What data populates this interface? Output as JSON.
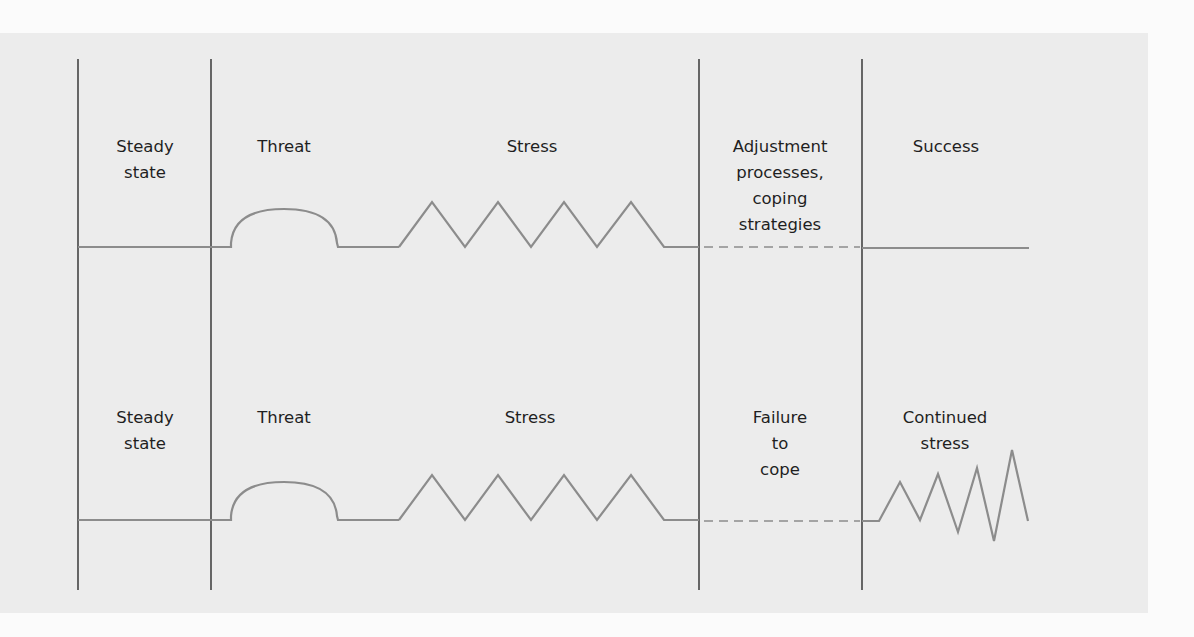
{
  "diagram": {
    "type": "stress-response flow",
    "colors": {
      "background": "#ececec",
      "divider": "#444444",
      "trace": "#8c8c8c",
      "text": "#1f1f1f"
    },
    "top_row": {
      "stages": [
        {
          "id": "steady-state",
          "label": "Steady\nstate"
        },
        {
          "id": "threat",
          "label": "Threat"
        },
        {
          "id": "stress",
          "label": "Stress"
        },
        {
          "id": "adjustment",
          "label": "Adjustment\nprocesses,\ncoping\nstrategies"
        },
        {
          "id": "success",
          "label": "Success"
        }
      ],
      "outcome": "Success"
    },
    "bottom_row": {
      "stages": [
        {
          "id": "steady-state",
          "label": "Steady\nstate"
        },
        {
          "id": "threat",
          "label": "Threat"
        },
        {
          "id": "stress",
          "label": "Stress"
        },
        {
          "id": "failure",
          "label": "Failure\nto\ncope"
        },
        {
          "id": "continued-stress",
          "label": "Continued\nstress"
        }
      ],
      "outcome": "Continued stress"
    },
    "traces": {
      "top": {
        "segments": [
          {
            "shape": "flat",
            "stage": "Steady state"
          },
          {
            "shape": "arc",
            "stage": "Threat"
          },
          {
            "shape": "zigzag-4-peaks",
            "stage": "Stress"
          },
          {
            "shape": "dashed",
            "stage": "Adjustment processes, coping strategies"
          },
          {
            "shape": "flat",
            "stage": "Success"
          }
        ]
      },
      "bottom": {
        "segments": [
          {
            "shape": "flat",
            "stage": "Steady state"
          },
          {
            "shape": "arc",
            "stage": "Threat"
          },
          {
            "shape": "zigzag-4-peaks",
            "stage": "Stress"
          },
          {
            "shape": "dashed",
            "stage": "Failure to cope"
          },
          {
            "shape": "growing-zigzag",
            "stage": "Continued stress"
          }
        ]
      }
    }
  }
}
